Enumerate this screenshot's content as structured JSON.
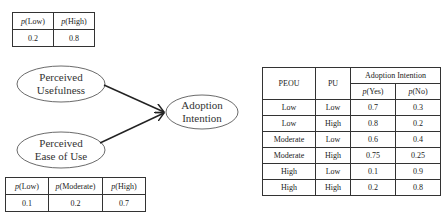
{
  "nodes": {
    "pu": {
      "line1": "Perceived",
      "line2": "Usefulness"
    },
    "peou": {
      "line1": "Perceived",
      "line2": "Ease of Use"
    },
    "ai": {
      "line1": "Adoption",
      "line2": "Intention"
    }
  },
  "pu_table": {
    "headers": [
      {
        "p": "p",
        "label": "(Low)"
      },
      {
        "p": "p",
        "label": "(High)"
      }
    ],
    "values": [
      "0.2",
      "0.8"
    ]
  },
  "peou_table": {
    "headers": [
      {
        "p": "p",
        "label": "(Low)"
      },
      {
        "p": "p",
        "label": "(Moderate)"
      },
      {
        "p": "p",
        "label": "(High)"
      }
    ],
    "values": [
      "0.1",
      "0.2",
      "0.7"
    ]
  },
  "ai_table": {
    "col_peou": "PEOU",
    "col_pu": "PU",
    "group_header": "Adoption Intention",
    "sub_headers": [
      {
        "p": "p",
        "label": "(Yes)"
      },
      {
        "p": "p",
        "label": "(No)"
      }
    ],
    "rows": [
      [
        "Low",
        "Low",
        "0.7",
        "0.3"
      ],
      [
        "Low",
        "High",
        "0.8",
        "0.2"
      ],
      [
        "Moderate",
        "Low",
        "0.6",
        "0.4"
      ],
      [
        "Moderate",
        "High",
        "0.75",
        "0.25"
      ],
      [
        "High",
        "Low",
        "0.1",
        "0.9"
      ],
      [
        "High",
        "High",
        "0.2",
        "0.8"
      ]
    ]
  }
}
